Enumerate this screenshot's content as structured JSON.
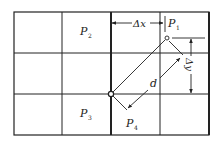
{
  "diagram": {
    "type": "grid-interpolation",
    "grid": {
      "columns": 4,
      "rows": 3,
      "x_lines": [
        14,
        62,
        111,
        160,
        209
      ],
      "y_lines": [
        12,
        53,
        94,
        135
      ],
      "thick_x": [
        111,
        209
      ],
      "line_color": "#222222"
    },
    "cells": [
      {
        "label": "P",
        "sub": "2",
        "x": 89,
        "y": 33
      },
      {
        "label": "P",
        "sub": "1",
        "x": 170,
        "y": 23
      },
      {
        "label": "P",
        "sub": "3",
        "x": 89,
        "y": 116
      },
      {
        "label": "P",
        "sub": "4",
        "x": 137,
        "y": 127
      }
    ],
    "points": [
      {
        "name": "P1-point",
        "x": 167,
        "y": 38
      },
      {
        "name": "origin-point",
        "x": 111,
        "y": 94
      }
    ],
    "dimensions": {
      "dx": {
        "label": "Δx",
        "y": 23,
        "x_from": 111,
        "x_to": 164
      },
      "dy": {
        "label": "Δy",
        "x": 190,
        "y_from": 38,
        "y_to": 94
      },
      "d": {
        "label": "d"
      }
    }
  }
}
